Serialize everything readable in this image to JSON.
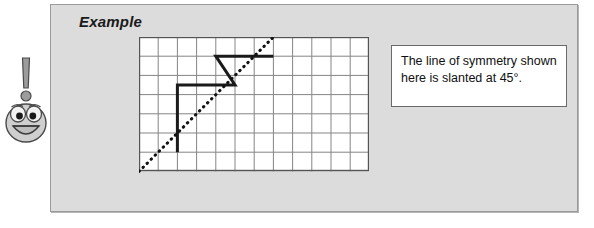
{
  "panel": {
    "title": "Example",
    "background_color": "#dcdcdc",
    "border_color": "#9a9a9a"
  },
  "mascot": {
    "name": "exclamation-face-mascot",
    "description": "Smiling cartoon face with exclamation mark above",
    "body_color": "#bfbfbf",
    "outline_color": "#4a4a4a"
  },
  "callout": {
    "text": "The line of symmetry shown here is slanted at 45°.",
    "background_color": "#ffffff",
    "border_color": "#6a6a6a"
  },
  "chart_data": {
    "type": "diagram",
    "title": "Example",
    "annotation": "The line of symmetry shown here is slanted at 45°.",
    "grid": {
      "columns": 12,
      "rows": 7,
      "cell_size": 19.2,
      "line_color": "#808080",
      "border_color": "#555555",
      "fill_color": "#ffffff"
    },
    "symmetry_line": {
      "label": "line of symmetry",
      "style": "dotted",
      "angle_degrees": 45,
      "color": "#111111",
      "from": [
        0,
        7
      ],
      "to": [
        7,
        0
      ]
    },
    "shape": {
      "label": "half figure (solid polyline)",
      "style": "solid",
      "color": "#1a1a1a",
      "points": [
        [
          2,
          6
        ],
        [
          2,
          2.5
        ],
        [
          5,
          2.5
        ],
        [
          4,
          1
        ],
        [
          7,
          1
        ]
      ]
    },
    "axis_note": "grid coordinates: x = column index from left, y = row index from top"
  }
}
